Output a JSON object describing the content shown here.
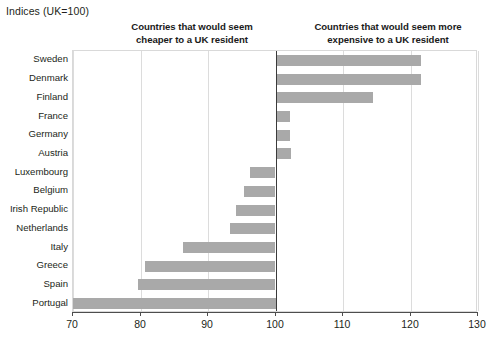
{
  "chart_data": {
    "type": "bar",
    "orientation": "horizontal",
    "title": "Indices (UK=100)",
    "xlabel": "",
    "ylabel": "",
    "xlim": [
      70,
      130
    ],
    "xticks": [
      70,
      80,
      90,
      100,
      110,
      120,
      130
    ],
    "xtick_labels": [
      "70",
      "80",
      "90",
      "100",
      "110",
      "120",
      "130"
    ],
    "grid": true,
    "baseline": 100,
    "legend": "none",
    "bar_color": "#a9a9a9",
    "baseline_color": "#3b3b3b",
    "gridline_color": "#dcdcdc",
    "annotations": [
      {
        "id": "cheaper",
        "text": "Countries that would seem cheaper to a UK resident",
        "position": "above-left"
      },
      {
        "id": "expensive",
        "text": "Countries that would seem more expensive to a UK resident",
        "position": "above-right"
      }
    ],
    "categories": [
      "Sweden",
      "Denmark",
      "Finland",
      "France",
      "Germany",
      "Austria",
      "Luxembourg",
      "Belgium",
      "Irish Republic",
      "Netherlands",
      "Italy",
      "Greece",
      "Spain",
      "Portugal"
    ],
    "values": [
      121.5,
      121.5,
      114.5,
      102.2,
      102.2,
      102.3,
      96.2,
      95.3,
      94.1,
      93.2,
      86.3,
      80.6,
      79.6,
      70.0
    ]
  },
  "annotation_lines": {
    "cheaper": [
      "Countries that would seem",
      "cheaper to a UK resident"
    ],
    "expensive": [
      "Countries that would seem more",
      "expensive to a UK resident"
    ]
  }
}
